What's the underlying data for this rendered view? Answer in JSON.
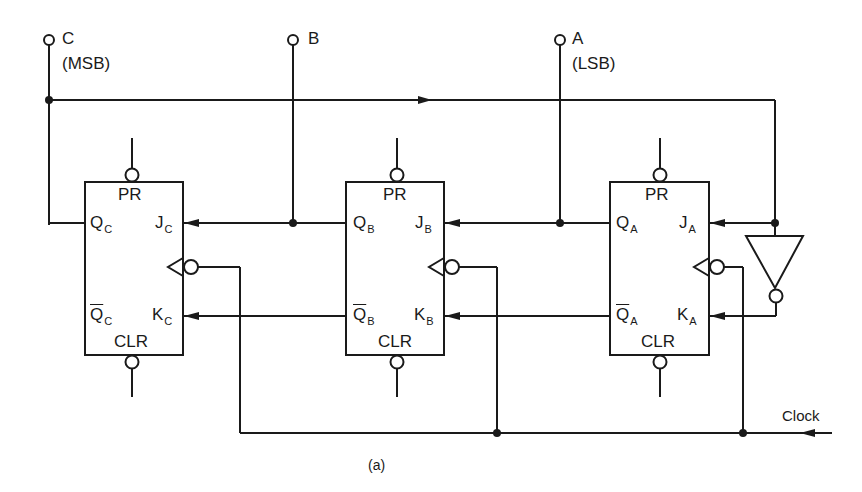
{
  "figure": {
    "caption": "(a)",
    "inputs": [
      {
        "id": "C",
        "label": "C",
        "note": "(MSB)"
      },
      {
        "id": "B",
        "label": "B",
        "note": ""
      },
      {
        "id": "A",
        "label": "A",
        "note": "(LSB)"
      }
    ],
    "clock_label": "Clock",
    "flip_flops": [
      {
        "id": "FF-C",
        "preset": "PR",
        "clear": "CLR",
        "q": "Q",
        "qbar": "Q",
        "j": "J",
        "k": "K",
        "sub": "C"
      },
      {
        "id": "FF-B",
        "preset": "PR",
        "clear": "CLR",
        "q": "Q",
        "qbar": "Q",
        "j": "J",
        "k": "K",
        "sub": "B"
      },
      {
        "id": "FF-A",
        "preset": "PR",
        "clear": "CLR",
        "q": "Q",
        "qbar": "Q",
        "j": "J",
        "k": "K",
        "sub": "A"
      }
    ],
    "inverter": {
      "type": "NOT gate"
    },
    "colors": {
      "line": "#1a1a1a",
      "background": "#ffffff"
    }
  }
}
